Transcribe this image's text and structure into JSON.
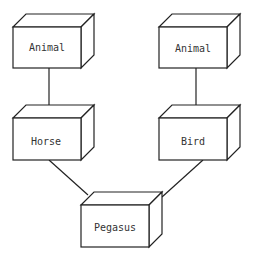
{
  "diagram": {
    "type": "class-inheritance",
    "stroke_color": "#222222",
    "nodes": [
      {
        "id": "animal_left",
        "label": "Animal",
        "x": 13,
        "y": 27,
        "w": 68,
        "h": 41
      },
      {
        "id": "animal_right",
        "label": "Animal",
        "x": 159,
        "y": 27,
        "w": 68,
        "h": 41
      },
      {
        "id": "horse",
        "label": "Horse",
        "x": 13,
        "y": 118,
        "w": 68,
        "h": 42
      },
      {
        "id": "bird",
        "label": "Bird",
        "x": 159,
        "y": 118,
        "w": 68,
        "h": 42
      },
      {
        "id": "pegasus",
        "label": "Pegasus",
        "x": 81,
        "y": 205,
        "w": 68,
        "h": 42
      }
    ],
    "edges": [
      {
        "from": "horse",
        "to": "animal_left"
      },
      {
        "from": "bird",
        "to": "animal_right"
      },
      {
        "from": "pegasus",
        "to": "horse"
      },
      {
        "from": "pegasus",
        "to": "bird"
      }
    ]
  }
}
